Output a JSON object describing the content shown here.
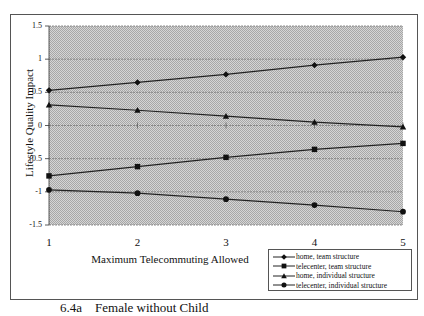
{
  "chart_data": {
    "type": "line",
    "title": "",
    "xlabel": "Maximum Telecommuting Allowed",
    "ylabel": "Lifestyle Quality Impact",
    "x": [
      1,
      2,
      3,
      4,
      5
    ],
    "xticks": [
      "1",
      "2",
      "3",
      "4",
      "5"
    ],
    "yticks": [
      "1.5",
      "1",
      "0.5",
      "0",
      "-0.5",
      "-1",
      "-1.5"
    ],
    "ylim": [
      -1.5,
      1.5
    ],
    "grid": "horizontal gridlines at 0.5 intervals",
    "legend_position": "bottom-right, below plot",
    "series": [
      {
        "name": "home, team structure",
        "marker": "diamond",
        "values": [
          0.53,
          0.65,
          0.77,
          0.91,
          1.03
        ]
      },
      {
        "name": "telecenter, team structure",
        "marker": "square",
        "values": [
          -0.76,
          -0.62,
          -0.48,
          -0.36,
          -0.27
        ]
      },
      {
        "name": "home, individual structure",
        "marker": "triangle",
        "values": [
          0.31,
          0.23,
          0.14,
          0.05,
          -0.02
        ]
      },
      {
        "name": "telecenter, individual structure",
        "marker": "circle",
        "values": [
          -0.97,
          -1.02,
          -1.11,
          -1.2,
          -1.3
        ]
      }
    ]
  },
  "caption": "6.4a    Female without Child"
}
